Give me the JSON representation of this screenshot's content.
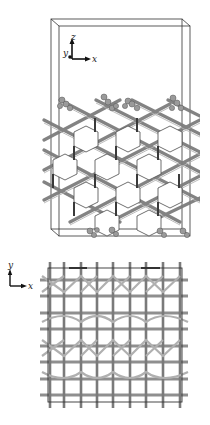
{
  "figure": {
    "panels": [
      {
        "id": "side-view",
        "description": "Side view of slab model in periodic simulation cell",
        "axes": {
          "vertical": "z",
          "horizontal": "x",
          "depth": "y"
        }
      },
      {
        "id": "top-view",
        "description": "Top view of lattice structure",
        "axes": {
          "vertical": "y",
          "horizontal": "x"
        }
      }
    ],
    "colors": {
      "bond": "#8a8a8a",
      "bond_dark": "#4a4a4a",
      "bond_light": "#b8b8b8",
      "cell": "#333333",
      "atom": "#9a9a9a"
    }
  },
  "labels": {
    "side_z": "z",
    "side_y": "y",
    "side_x": "x",
    "top_y": "y",
    "top_x": "x"
  }
}
